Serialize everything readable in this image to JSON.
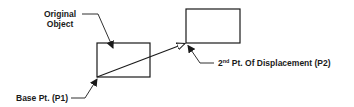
{
  "diagram": {
    "labels": {
      "original_object_line1": "Original",
      "original_object_line2": "Object",
      "base_point": "Base Pt. (P1)",
      "second_point_prefix": "2",
      "second_point_sup": "nd",
      "second_point_rest": " Pt. Of Displacement (P2)"
    },
    "shapes": {
      "original_rect": {
        "x": 97,
        "y": 43,
        "w": 53,
        "h": 34
      },
      "moved_rect": {
        "x": 186,
        "y": 9,
        "w": 54,
        "h": 34
      },
      "displacement_vector": {
        "from": [
          97,
          77
        ],
        "to": [
          186,
          43
        ]
      }
    },
    "colors": {
      "stroke": "#1a1a1a",
      "background": "#ffffff"
    }
  }
}
